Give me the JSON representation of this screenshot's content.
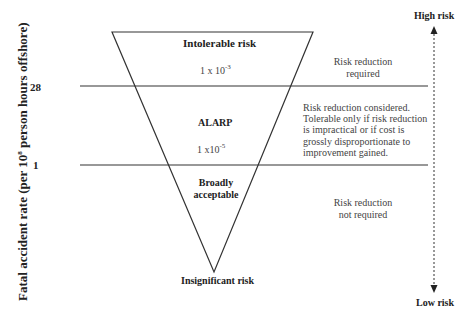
{
  "diagram": {
    "type": "ALARP risk triangle",
    "y_axis": {
      "label_prefix": "Fatal accident rate (per 10",
      "label_exp": "8",
      "label_suffix": " person hours offshore)",
      "ticks": [
        "28",
        "1"
      ]
    },
    "triangle": {
      "regions": [
        {
          "name": "Intolerable risk",
          "value_base": "1 x 10",
          "value_exp": "-3"
        },
        {
          "name": "ALARP",
          "value_base": "1 x10",
          "value_exp": "-5"
        },
        {
          "name_line1": "Broadly",
          "name_line2": "acceptable"
        }
      ],
      "apex_label": "Insignificant risk"
    },
    "notes": {
      "top": [
        "Risk reduction",
        "required"
      ],
      "middle": [
        "Risk reduction considered.",
        "Tolerable only if risk reduction",
        "is impractical or if cost is",
        "grossly disproportionate to",
        "improvement gained."
      ],
      "bottom": [
        "Risk reduction",
        "not required"
      ]
    },
    "scale_arrow": {
      "top_label": "High risk",
      "bottom_label": "Low risk"
    },
    "colors": {
      "line": "#333333",
      "text": "#222222",
      "background": "#ffffff"
    }
  }
}
